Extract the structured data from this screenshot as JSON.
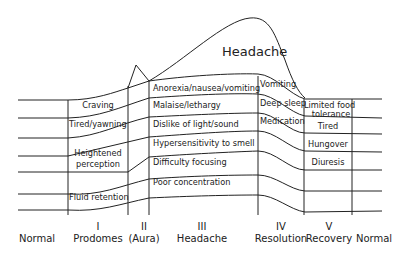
{
  "diagram": {
    "title": "Headache",
    "phases": [
      {
        "numeral": "",
        "label": "Normal"
      },
      {
        "numeral": "I",
        "label": "Prodomes"
      },
      {
        "numeral": "II",
        "label": "(Aura)"
      },
      {
        "numeral": "III",
        "label": "Headache"
      },
      {
        "numeral": "IV",
        "label": "Resolution"
      },
      {
        "numeral": "V",
        "label": "Recovery"
      },
      {
        "numeral": "",
        "label": "Normal"
      }
    ],
    "prodromes": {
      "craving": "Craving",
      "tired_yawning": "Tired/yawning",
      "heightened": "Heightened",
      "perception": "perception",
      "fluid_retention": "Fluid retention"
    },
    "headache": {
      "anorexia": "Anorexia/nausea/vomiting",
      "malaise": "Malaise/lethargy",
      "dislike": "Dislike of light/sound",
      "hypersensitivity": "Hypersensitivity to smell",
      "difficulty": "Difficulty focusing",
      "poor_concentration": "Poor concentration"
    },
    "resolution": {
      "vomiting": "Vomiting",
      "deep_sleep": "Deep sleep",
      "medication": "Medication"
    },
    "recovery": {
      "limited_food": "Limited food",
      "tolerance": "tolerance",
      "tired": "Tired",
      "hungover": "Hungover",
      "diuresis": "Diuresis"
    }
  }
}
